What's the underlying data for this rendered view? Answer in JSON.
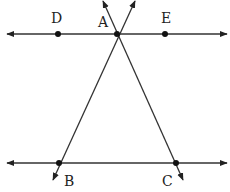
{
  "diagram": {
    "type": "geometry",
    "line_color": "#333333",
    "point_color": "#111111",
    "lines": [
      {
        "id": "DE",
        "name": "top-parallel-line",
        "from": [
          7,
          34
        ],
        "to": [
          227,
          34
        ],
        "arrows": "both"
      },
      {
        "id": "BC",
        "name": "bottom-parallel-line",
        "from": [
          7,
          163
        ],
        "to": [
          227,
          163
        ],
        "arrows": "both"
      },
      {
        "id": "AB",
        "name": "transversal-AB",
        "from": [
          135,
          1
        ],
        "to": [
          53,
          180
        ],
        "arrows": "both"
      },
      {
        "id": "AC",
        "name": "transversal-AC",
        "from": [
          103,
          1
        ],
        "to": [
          183,
          180
        ],
        "arrows": "both"
      }
    ],
    "points": [
      {
        "label": "D",
        "x": 58,
        "y": 34,
        "label_x": 51,
        "label_y": 23
      },
      {
        "label": "A",
        "x": 117,
        "y": 34,
        "label_x": 98,
        "label_y": 27
      },
      {
        "label": "E",
        "x": 165,
        "y": 34,
        "label_x": 161,
        "label_y": 23
      },
      {
        "label": "B",
        "x": 59,
        "y": 163,
        "label_x": 64,
        "label_y": 186
      },
      {
        "label": "C",
        "x": 176,
        "y": 163,
        "label_x": 162,
        "label_y": 186
      }
    ]
  }
}
